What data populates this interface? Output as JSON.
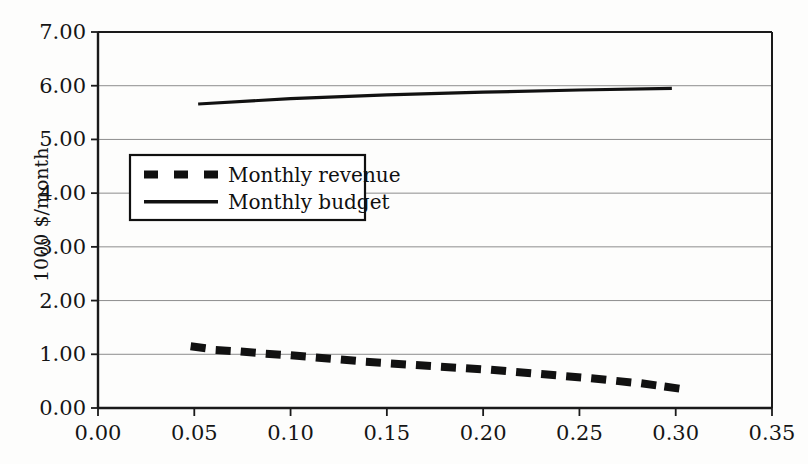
{
  "chart_data": {
    "type": "line",
    "title": "",
    "xlabel": "",
    "ylabel": "1000 $/month",
    "xlim": [
      0.0,
      0.35
    ],
    "ylim": [
      0.0,
      7.0
    ],
    "xticks": [
      "0.00",
      "0.05",
      "0.10",
      "0.15",
      "0.20",
      "0.25",
      "0.30",
      "0.35"
    ],
    "xtick_values": [
      0.0,
      0.05,
      0.1,
      0.15,
      0.2,
      0.25,
      0.3,
      0.35
    ],
    "yticks": [
      "0.00",
      "1.00",
      "2.00",
      "3.00",
      "4.00",
      "5.00",
      "6.00",
      "7.00"
    ],
    "ytick_values": [
      0.0,
      1.0,
      2.0,
      3.0,
      4.0,
      5.0,
      6.0,
      7.0
    ],
    "grid": "horizontal",
    "legend_position": "center-left",
    "series": [
      {
        "name": "Monthly revenue",
        "style": "dashed",
        "color": "#111111",
        "x": [
          0.052,
          0.065,
          0.078,
          0.091,
          0.104,
          0.117,
          0.13,
          0.143,
          0.156,
          0.169,
          0.182,
          0.195,
          0.208,
          0.221,
          0.234,
          0.247,
          0.26,
          0.273,
          0.286,
          0.298
        ],
        "y": [
          1.13,
          1.07,
          1.04,
          1.0,
          0.97,
          0.93,
          0.89,
          0.85,
          0.82,
          0.79,
          0.76,
          0.73,
          0.7,
          0.66,
          0.62,
          0.58,
          0.54,
          0.49,
          0.44,
          0.38
        ]
      },
      {
        "name": "Monthly budget",
        "style": "solid",
        "color": "#111111",
        "x": [
          0.052,
          0.1,
          0.15,
          0.2,
          0.25,
          0.298
        ],
        "y": [
          5.66,
          5.76,
          5.83,
          5.88,
          5.92,
          5.95
        ]
      }
    ]
  },
  "legend": {
    "items": [
      {
        "label": "Monthly revenue",
        "style": "dashed"
      },
      {
        "label": "Monthly budget",
        "style": "solid"
      }
    ]
  }
}
